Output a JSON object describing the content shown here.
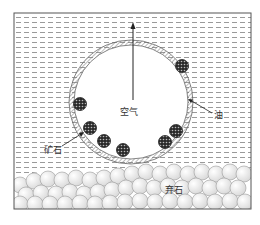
{
  "figure": {
    "caption_partial": "",
    "labels": {
      "air": "空气",
      "oil": "油",
      "ore": "矿石",
      "gangue": "弃石"
    },
    "colors": {
      "border": "#555555",
      "dash": "#9a9a9a",
      "ring_stroke": "#666666",
      "particle_fill": "#2a2a2a",
      "gangue_fill": "#eeeeee",
      "gangue_stroke": "#999999"
    },
    "bubble": {
      "cx": 131,
      "cy": 102,
      "r_outer": 62,
      "r_inner": 57
    },
    "ore_particles": [
      {
        "cx": 182,
        "cy": 66
      },
      {
        "cx": 80,
        "cy": 104
      },
      {
        "cx": 90,
        "cy": 128
      },
      {
        "cx": 104,
        "cy": 141
      },
      {
        "cx": 123,
        "cy": 150
      },
      {
        "cx": 165,
        "cy": 142
      },
      {
        "cx": 176,
        "cy": 131
      }
    ]
  }
}
